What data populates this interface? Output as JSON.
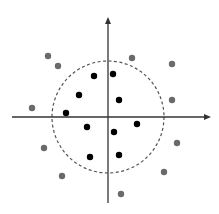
{
  "diagram": {
    "type": "scatter-classification",
    "colors": {
      "axis": "#333333",
      "circle": "#555555",
      "inner_point": "#000000",
      "outer_point": "#6a6a6a",
      "background": "#ffffff"
    },
    "axes": {
      "origin": [
        108,
        117
      ],
      "x_start": 12,
      "x_end": 211,
      "y_start": 203,
      "y_end": 17
    },
    "boundary_circle": {
      "cx": 108,
      "cy": 117,
      "r": 56,
      "style": "dashed"
    },
    "inner_points": [
      [
        94,
        76
      ],
      [
        113,
        74
      ],
      [
        79,
        95
      ],
      [
        119,
        100
      ],
      [
        66,
        113
      ],
      [
        87,
        127
      ],
      [
        114,
        132
      ],
      [
        137,
        124
      ],
      [
        90,
        157
      ],
      [
        119,
        155
      ]
    ],
    "outer_points": [
      [
        48,
        56
      ],
      [
        58,
        66
      ],
      [
        32,
        108
      ],
      [
        44,
        148
      ],
      [
        62,
        176
      ],
      [
        132,
        58
      ],
      [
        172,
        64
      ],
      [
        172,
        100
      ],
      [
        177,
        143
      ],
      [
        164,
        172
      ],
      [
        121,
        194
      ]
    ]
  }
}
